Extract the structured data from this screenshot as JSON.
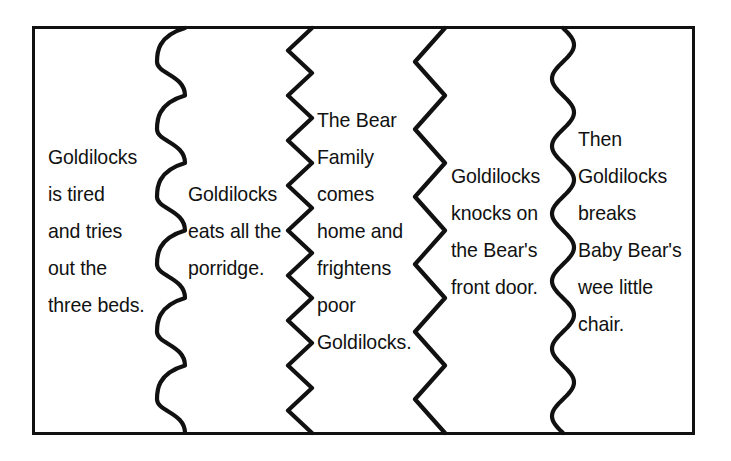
{
  "figure": {
    "kind": "story-sequence-frame",
    "border_color": "#111111",
    "background_color": "#ffffff",
    "text_color": "#111111"
  },
  "panels": [
    {
      "id": "panel-1",
      "name": "goldilocks-tries-beds",
      "lines": [
        "Goldilocks",
        "is tired",
        "and tries",
        "out the",
        "three beds."
      ]
    },
    {
      "id": "panel-2",
      "name": "goldilocks-eats-porridge",
      "lines": [
        "Goldilocks",
        "eats all the",
        "porridge."
      ]
    },
    {
      "id": "panel-3",
      "name": "bear-family-comes-home",
      "lines": [
        "The Bear",
        "Family",
        "comes",
        "home and",
        "frightens",
        "poor",
        "Goldilocks."
      ]
    },
    {
      "id": "panel-4",
      "name": "goldilocks-knocks-door",
      "lines": [
        "Goldilocks",
        "knocks on",
        "the Bear's",
        "front door."
      ]
    },
    {
      "id": "panel-5",
      "name": "goldilocks-breaks-chair",
      "lines": [
        "Then",
        "Goldilocks",
        "breaks",
        "Baby Bear's",
        "wee little",
        "chair."
      ]
    }
  ],
  "dividers": [
    {
      "id": "divider-1",
      "name": "scalloped-brace-divider",
      "style": "scallop",
      "x_left": 157,
      "x_right": 185,
      "cycles": 6
    },
    {
      "id": "divider-2",
      "name": "tight-zigzag-divider",
      "style": "zigzag",
      "x_left": 288,
      "x_right": 312,
      "cycles": 9
    },
    {
      "id": "divider-3",
      "name": "wide-zigzag-divider",
      "style": "zigzag",
      "x_left": 415,
      "x_right": 445,
      "cycles": 6
    },
    {
      "id": "divider-4",
      "name": "sine-wave-divider",
      "style": "sine",
      "x_left": 552,
      "x_right": 574,
      "cycles": 6
    }
  ]
}
